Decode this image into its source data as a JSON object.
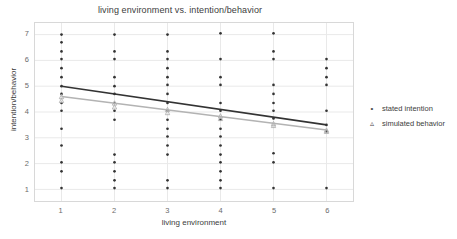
{
  "chart_data": {
    "type": "scatter",
    "title": "living environment vs. intention/behavior",
    "xlabel": "living environment",
    "ylabel": "intention/behavior",
    "xlim": [
      0.5,
      6.5
    ],
    "ylim": [
      0.55,
      7.45
    ],
    "xticks": [
      1,
      2,
      3,
      4,
      5,
      6
    ],
    "yticks": [
      1,
      2,
      3,
      4,
      5,
      6,
      7
    ],
    "grid": true,
    "legend_position": "right",
    "colors": {
      "stated_intention": "#333333",
      "simulated_behavior": "#b3b3b3",
      "grid": "#e9e9e9",
      "frame": "#d8d8d8",
      "text": "#4a4a4a"
    },
    "series": [
      {
        "name": "stated intention",
        "marker": "dot",
        "color": "#333333",
        "fit_line": {
          "x": [
            1,
            6
          ],
          "y": [
            5.0,
            3.5
          ]
        },
        "points": [
          {
            "x": 1,
            "y": 7.0
          },
          {
            "x": 1,
            "y": 6.7
          },
          {
            "x": 1,
            "y": 6.35
          },
          {
            "x": 1,
            "y": 6.05
          },
          {
            "x": 1,
            "y": 5.7
          },
          {
            "x": 1,
            "y": 5.35
          },
          {
            "x": 1,
            "y": 5.0
          },
          {
            "x": 1,
            "y": 4.7
          },
          {
            "x": 1,
            "y": 4.35
          },
          {
            "x": 1,
            "y": 4.05
          },
          {
            "x": 1,
            "y": 3.35
          },
          {
            "x": 1,
            "y": 2.7
          },
          {
            "x": 1,
            "y": 2.05
          },
          {
            "x": 1,
            "y": 1.7
          },
          {
            "x": 1,
            "y": 1.05
          },
          {
            "x": 2,
            "y": 7.0
          },
          {
            "x": 2,
            "y": 6.35
          },
          {
            "x": 2,
            "y": 6.05
          },
          {
            "x": 2,
            "y": 5.35
          },
          {
            "x": 2,
            "y": 5.0
          },
          {
            "x": 2,
            "y": 4.7
          },
          {
            "x": 2,
            "y": 4.35
          },
          {
            "x": 2,
            "y": 4.05
          },
          {
            "x": 2,
            "y": 3.7
          },
          {
            "x": 2,
            "y": 2.35
          },
          {
            "x": 2,
            "y": 2.05
          },
          {
            "x": 2,
            "y": 1.7
          },
          {
            "x": 2,
            "y": 1.35
          },
          {
            "x": 2,
            "y": 1.05
          },
          {
            "x": 3,
            "y": 7.0
          },
          {
            "x": 3,
            "y": 6.35
          },
          {
            "x": 3,
            "y": 6.05
          },
          {
            "x": 3,
            "y": 5.7
          },
          {
            "x": 3,
            "y": 5.35
          },
          {
            "x": 3,
            "y": 5.05
          },
          {
            "x": 3,
            "y": 4.7
          },
          {
            "x": 3,
            "y": 4.35
          },
          {
            "x": 3,
            "y": 4.05
          },
          {
            "x": 3,
            "y": 3.7
          },
          {
            "x": 3,
            "y": 3.35
          },
          {
            "x": 3,
            "y": 3.05
          },
          {
            "x": 3,
            "y": 2.7
          },
          {
            "x": 3,
            "y": 2.35
          },
          {
            "x": 3,
            "y": 1.35
          },
          {
            "x": 3,
            "y": 1.05
          },
          {
            "x": 4,
            "y": 7.05
          },
          {
            "x": 4,
            "y": 6.05
          },
          {
            "x": 4,
            "y": 5.35
          },
          {
            "x": 4,
            "y": 5.05
          },
          {
            "x": 4,
            "y": 4.35
          },
          {
            "x": 4,
            "y": 4.05
          },
          {
            "x": 4,
            "y": 3.7
          },
          {
            "x": 4,
            "y": 3.35
          },
          {
            "x": 4,
            "y": 3.05
          },
          {
            "x": 4,
            "y": 2.7
          },
          {
            "x": 4,
            "y": 2.35
          },
          {
            "x": 4,
            "y": 2.05
          },
          {
            "x": 4,
            "y": 1.7
          },
          {
            "x": 4,
            "y": 1.35
          },
          {
            "x": 4,
            "y": 1.05
          },
          {
            "x": 5,
            "y": 7.05
          },
          {
            "x": 5,
            "y": 6.35
          },
          {
            "x": 5,
            "y": 6.05
          },
          {
            "x": 5,
            "y": 5.05
          },
          {
            "x": 5,
            "y": 4.7
          },
          {
            "x": 5,
            "y": 4.35
          },
          {
            "x": 5,
            "y": 4.05
          },
          {
            "x": 5,
            "y": 3.75
          },
          {
            "x": 5,
            "y": 2.4
          },
          {
            "x": 5,
            "y": 2.05
          },
          {
            "x": 5,
            "y": 1.05
          },
          {
            "x": 6,
            "y": 6.05
          },
          {
            "x": 6,
            "y": 5.7
          },
          {
            "x": 6,
            "y": 5.35
          },
          {
            "x": 6,
            "y": 5.05
          },
          {
            "x": 6,
            "y": 4.05
          },
          {
            "x": 6,
            "y": 3.5
          },
          {
            "x": 6,
            "y": 3.25
          },
          {
            "x": 6,
            "y": 1.05
          }
        ]
      },
      {
        "name": "simulated behavior",
        "marker": "triangle",
        "color": "#b3b3b3",
        "fit_line": {
          "x": [
            1,
            6
          ],
          "y": [
            4.6,
            3.3
          ]
        },
        "points": [
          {
            "x": 1,
            "y": 4.6
          },
          {
            "x": 1,
            "y": 4.45
          },
          {
            "x": 2,
            "y": 4.35
          },
          {
            "x": 2,
            "y": 4.2
          },
          {
            "x": 3,
            "y": 4.1
          },
          {
            "x": 3,
            "y": 3.98
          },
          {
            "x": 4,
            "y": 3.85
          },
          {
            "x": 4,
            "y": 3.75
          },
          {
            "x": 5,
            "y": 3.55
          },
          {
            "x": 5,
            "y": 3.48
          },
          {
            "x": 6,
            "y": 3.3
          },
          {
            "x": 6,
            "y": 3.25
          }
        ]
      }
    ]
  },
  "legend": {
    "items": [
      {
        "label": "stated intention",
        "marker": "•",
        "color": "#333333"
      },
      {
        "label": "simulated behavior",
        "marker": "▵",
        "color": "#b3b3b3"
      }
    ]
  }
}
